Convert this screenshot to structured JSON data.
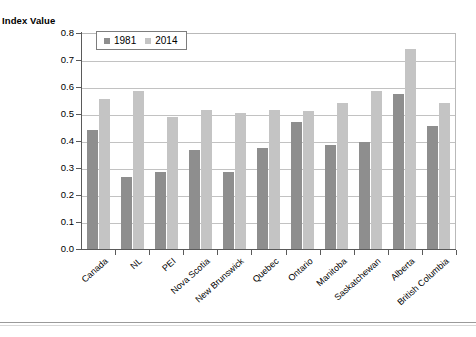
{
  "chart_data": {
    "type": "bar",
    "title": "",
    "xlabel": "",
    "ylabel": "Index Value",
    "ylim": [
      0.0,
      0.8
    ],
    "yticks": [
      "0.0",
      "0.1",
      "0.2",
      "0.3",
      "0.4",
      "0.5",
      "0.6",
      "0.7",
      "0.8"
    ],
    "grid": true,
    "legend_position": "top-left",
    "categories": [
      "Canada",
      "NL",
      "PEI",
      "Nova Scotia",
      "New Brunswick",
      "Quebec",
      "Ontario",
      "Manitoba",
      "Saskatchewan",
      "Alberta",
      "British Columbia"
    ],
    "series": [
      {
        "name": "1981",
        "color": "#8e8e8e",
        "values": [
          0.44,
          0.265,
          0.285,
          0.365,
          0.285,
          0.375,
          0.47,
          0.385,
          0.395,
          0.575,
          0.455
        ]
      },
      {
        "name": "2014",
        "color": "#c4c4c4",
        "values": [
          0.555,
          0.585,
          0.49,
          0.515,
          0.505,
          0.515,
          0.51,
          0.54,
          0.585,
          0.74,
          0.54
        ]
      }
    ]
  },
  "axis": {
    "y_title": "Index Value"
  },
  "colors": {
    "series_1981": "#8e8e8e",
    "series_2014": "#c4c4c4",
    "gridline": "#c2c2c2",
    "axis": "#5a5a5a"
  }
}
